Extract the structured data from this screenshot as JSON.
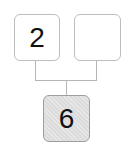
{
  "diagram": {
    "type": "number-bond",
    "parts": [
      {
        "id": "part-left",
        "value": "2"
      },
      {
        "id": "part-right",
        "value": ""
      }
    ],
    "whole": {
      "id": "whole",
      "value": "6",
      "shaded": true
    },
    "colors": {
      "border": "#bdbdbd",
      "line": "#b5b5b5",
      "whole_fill": "#dcdcdc"
    }
  }
}
